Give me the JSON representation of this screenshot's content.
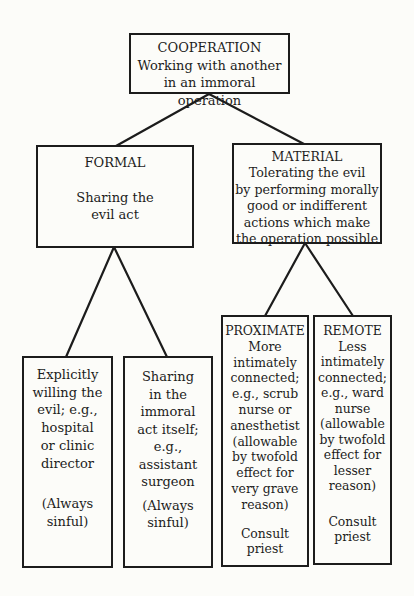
{
  "page": {
    "background_color": "#fcfcf9",
    "ink_color": "#1c1c1c"
  },
  "diagram": {
    "root": {
      "heading": "COOPERATION",
      "body": "Working with another\nin an immoral operation"
    },
    "formal": {
      "heading": "FORMAL",
      "body": "Sharing the\nevil act"
    },
    "material": {
      "heading": "MATERIAL",
      "body": "Tolerating the evil\nby performing morally\ngood or indifferent\nactions which make\nthe operation possible"
    },
    "explicit": {
      "body": "Explicitly\nwilling the\nevil; e.g.,\nhospital\nor clinic\ndirector",
      "footer": "(Always\nsinful)"
    },
    "sharing": {
      "body": "Sharing\nin the\nimmoral\nact itself;\ne.g.,\nassistant\nsurgeon",
      "footer": "(Always\nsinful)"
    },
    "proximate": {
      "heading": "PROXIMATE",
      "body": "More\nintimately\nconnected;\ne.g., scrub\nnurse or\nanesthetist\n(allowable\nby twofold\neffect for\nvery grave\nreason)",
      "footer": "Consult\npriest"
    },
    "remote": {
      "heading": "REMOTE",
      "body": "Less\nintimately\nconnected;\ne.g., ward\nnurse\n(allowable\nby twofold\neffect for\nlesser\nreason)",
      "footer": "Consult\npriest"
    }
  }
}
